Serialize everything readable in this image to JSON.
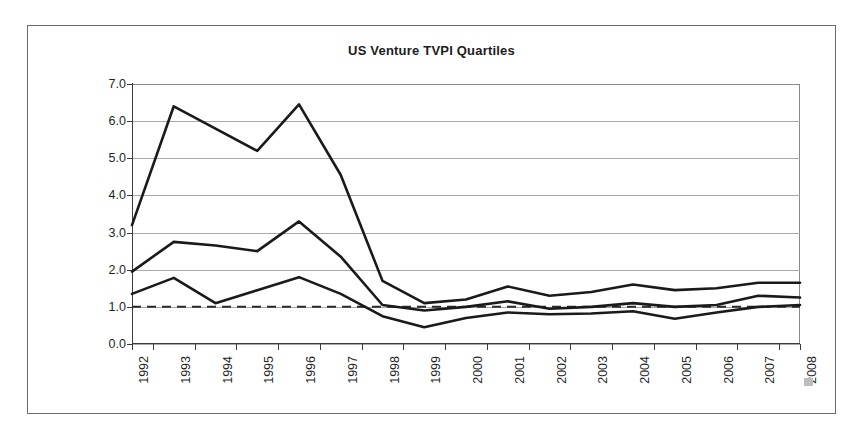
{
  "page": {
    "background_color": "#ffffff",
    "frame_border_color": "#6b6b6b"
  },
  "chart_data": {
    "type": "line",
    "title": "US Venture TVPI Quartiles",
    "xlabel": "",
    "ylabel": "",
    "categories": [
      "1992",
      "1993",
      "1994",
      "1995",
      "1996",
      "1997",
      "1998",
      "1999",
      "2000",
      "2001",
      "2002",
      "2003",
      "2004",
      "2005",
      "2006",
      "2007",
      "2008"
    ],
    "ylim": [
      0.0,
      7.0
    ],
    "ytick_labels": [
      "0.0",
      "1.0",
      "2.0",
      "3.0",
      "4.0",
      "5.0",
      "6.0",
      "7.0"
    ],
    "ytick_values": [
      0.0,
      1.0,
      2.0,
      3.0,
      4.0,
      5.0,
      6.0,
      7.0
    ],
    "grid": true,
    "grid_color": "#a8a8a8",
    "legend": "none",
    "line_color": "#1a1a1a",
    "series": [
      {
        "name": "Upper Quartile",
        "values": [
          3.2,
          6.4,
          5.8,
          5.2,
          6.45,
          4.55,
          1.7,
          1.1,
          1.2,
          1.55,
          1.3,
          1.4,
          1.6,
          1.45,
          1.5,
          1.65,
          1.65
        ]
      },
      {
        "name": "Median",
        "values": [
          1.95,
          2.75,
          2.65,
          2.5,
          3.3,
          2.35,
          1.05,
          0.9,
          1.0,
          1.15,
          0.95,
          1.0,
          1.1,
          1.0,
          1.05,
          1.3,
          1.25
        ]
      },
      {
        "name": "Lower Quartile",
        "values": [
          1.35,
          1.78,
          1.1,
          1.45,
          1.8,
          1.35,
          0.75,
          0.45,
          0.7,
          0.85,
          0.8,
          0.82,
          0.88,
          0.68,
          0.85,
          1.0,
          1.05
        ]
      }
    ],
    "reference_line": {
      "name": "TVPI = 1.0x",
      "value": 1.0,
      "style": "dashed",
      "color": "#2b2b2b"
    }
  }
}
